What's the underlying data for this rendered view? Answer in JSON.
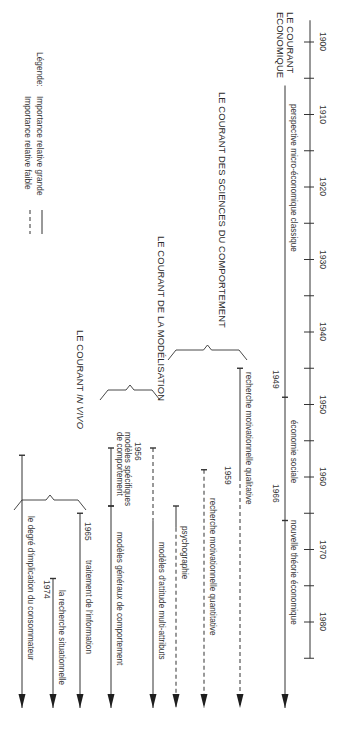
{
  "timeline": {
    "axis_x": 310,
    "start_year": 1900,
    "end_year": 1985,
    "y_at_1900": 42,
    "px_per_year": 7.25,
    "tick_every": 5,
    "label_every": 10,
    "labels": [
      "1900",
      "1910",
      "1920",
      "1930",
      "1940",
      "1950",
      "1960",
      "1970",
      "1980"
    ]
  },
  "arrow_end_y": 708,
  "currents": [
    {
      "title": "LE COURANT\nECONOMIQUE",
      "title_lines": [
        "LE COURANT",
        "ECONOMIQUE"
      ],
      "title_pos": {
        "x": 278,
        "y": 12
      }
    },
    {
      "title": "LE COURANT DES SCIENCES DU COMPORTEMENT",
      "title_pos": {
        "x": 220,
        "y": 92
      }
    },
    {
      "title": "LE COURANT DE LA MODÉLISATION",
      "title_pos": {
        "x": 160,
        "y": 236
      }
    },
    {
      "title_prefix": "LE COURANT ",
      "title_italic": "IN VIVO",
      "title_pos": {
        "x": 78,
        "y": 330
      }
    }
  ],
  "streams": [
    {
      "id": "micro-economique",
      "label": "perspective micro-économique classique",
      "x": 285,
      "start_year": 1906,
      "end_year": 1949,
      "style": "solid",
      "start_tick": false,
      "arrow": false
    },
    {
      "id": "economie-sociale",
      "label": "économie sociale",
      "x": 285,
      "start_year": 1949,
      "end_year": 1966,
      "style": "solid",
      "start_tick": true,
      "arrow": false,
      "year_label": "1949"
    },
    {
      "id": "nouvelle-theorie",
      "label": "nouvelle théorie économique",
      "x": 285,
      "start_year": 1966,
      "end_year": 1985,
      "style": "solid",
      "start_tick": true,
      "arrow": true,
      "year_label": "1966"
    },
    {
      "id": "motiv-qualitative",
      "label": "recherche motivationnelle qualitative",
      "x": 240,
      "start_year": 1945,
      "solid_until_year": 1960,
      "style": "solid-then-dashed",
      "start_tick": true,
      "arrow": true
    },
    {
      "id": "motiv-quantitative",
      "label": "recherche motivationnelle quantitative",
      "x": 204,
      "start_year": 1959,
      "solid_until_year": 1959.5,
      "style": "dashed",
      "start_tick": true,
      "arrow": true,
      "year_label": "1959"
    },
    {
      "id": "psychographie",
      "label": "psychographie",
      "x": 176,
      "start_year": 1964,
      "solid_until_year": 1967,
      "style": "solid-then-dashed",
      "start_tick": true,
      "arrow": true
    },
    {
      "id": "attitude-multi",
      "label": "modèles d'attitude multi-attributs",
      "x": 153,
      "start_year": 1956,
      "solid_until_year": 1966,
      "style": "dashed-then-solid",
      "start_tick": true,
      "arrow": true,
      "year_label": "1956"
    },
    {
      "id": "modeles-specifiques",
      "label": "modèles spécifiques\nde comportement",
      "label_lines": [
        "modèles spécifiques",
        "de comportement"
      ],
      "x": 111,
      "start_year": 1956,
      "end_tick_year": 1964,
      "style": "solid",
      "start_tick": true,
      "arrow": false
    },
    {
      "id": "modeles-generaux",
      "label": "modèles généraux de comportement",
      "x": 111,
      "start_year": 1964,
      "style": "solid",
      "start_tick": true,
      "arrow": true
    },
    {
      "id": "traitement-information",
      "label": "traitement de l'information",
      "x": 80,
      "start_year": 1965,
      "style": "solid",
      "start_tick": true,
      "arrow": true,
      "year_label": "1965"
    },
    {
      "id": "recherche-situationnelle",
      "label": "la recherche situationnelle",
      "x": 53,
      "start_year": 1974,
      "style": "solid",
      "start_tick": true,
      "arrow": true,
      "year_label": "1974"
    },
    {
      "id": "degre-implication",
      "label": "le degré d'implication du consommateur",
      "x": 22,
      "start_year": 1957,
      "style": "solid",
      "start_tick": true,
      "arrow": true
    }
  ],
  "braces": [
    {
      "id": "brace-comportement",
      "x_left": 168,
      "x_right": 247,
      "y": 350
    },
    {
      "id": "brace-modelisation",
      "x_left": 100,
      "x_right": 160,
      "y": 390
    },
    {
      "id": "brace-invivo",
      "x_left": 14,
      "x_right": 86,
      "y": 500
    }
  ],
  "legend": {
    "title": "Légende:",
    "items": [
      {
        "label": "Importance relative grande",
        "style": "solid"
      },
      {
        "label": "Importance relative faible",
        "style": "dashed"
      }
    ]
  },
  "colors": {
    "line": "#333333",
    "text": "#333333",
    "background": "#ffffff"
  }
}
